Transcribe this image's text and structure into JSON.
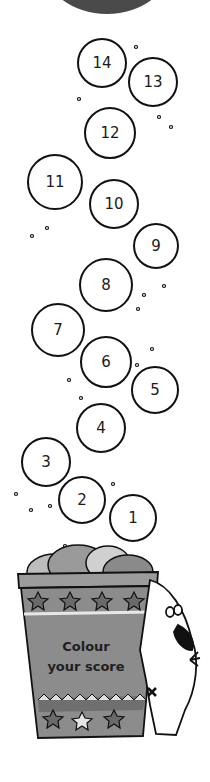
{
  "header": {
    "shape": "dark-semicircle",
    "color": "#4a4a4a"
  },
  "bubbles": [
    {
      "label": "14",
      "x": 102,
      "y": 63
    },
    {
      "label": "13",
      "x": 153,
      "y": 82
    },
    {
      "label": "12",
      "x": 110,
      "y": 133
    },
    {
      "label": "11",
      "x": 55,
      "y": 182
    },
    {
      "label": "10",
      "x": 114,
      "y": 204
    },
    {
      "label": "9",
      "x": 156,
      "y": 246
    },
    {
      "label": "8",
      "x": 106,
      "y": 285
    },
    {
      "label": "7",
      "x": 58,
      "y": 330
    },
    {
      "label": "6",
      "x": 106,
      "y": 362
    },
    {
      "label": "5",
      "x": 155,
      "y": 390
    },
    {
      "label": "4",
      "x": 101,
      "y": 428
    },
    {
      "label": "3",
      "x": 46,
      "y": 462
    },
    {
      "label": "2",
      "x": 82,
      "y": 500
    },
    {
      "label": "1",
      "x": 133,
      "y": 518
    }
  ],
  "bucket": {
    "text_line1": "Colour",
    "text_line2": "your score",
    "color": "#8c8c8c",
    "band_color": "#a6a6a6"
  },
  "mascot": {
    "type": "spotted-dog",
    "mark": "x"
  }
}
